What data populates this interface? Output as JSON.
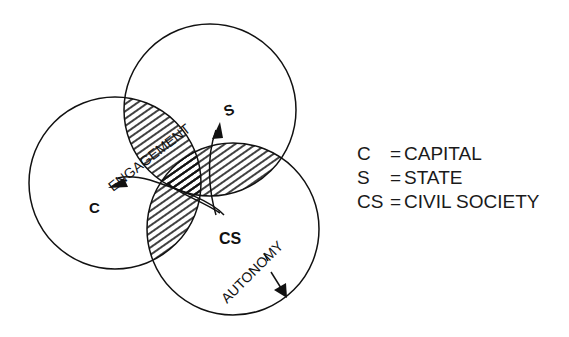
{
  "diagram": {
    "circles": [
      {
        "id": "capital",
        "label": "C",
        "cx": 115,
        "cy": 183,
        "r": 86
      },
      {
        "id": "state",
        "label": "S",
        "cx": 210,
        "cy": 110,
        "r": 86
      },
      {
        "id": "civil-society",
        "label": "CS",
        "cx": 233,
        "cy": 229,
        "r": 86
      }
    ],
    "labels": {
      "c": "C",
      "s": "S",
      "cs": "CS",
      "engagement": "ENGAGEMENT",
      "autonomy": "AUTONOMY"
    },
    "hatched_regions": [
      "C∩S",
      "S∩CS",
      "C∩CS"
    ],
    "stroke_color": "#111111",
    "background": "#ffffff"
  },
  "legend": {
    "items": [
      {
        "key": "C",
        "eq": "=",
        "value": "CAPITAL"
      },
      {
        "key": "S",
        "eq": "=",
        "value": "STATE"
      },
      {
        "key": "CS",
        "eq": "=",
        "value": "CIVIL SOCIETY"
      }
    ]
  }
}
